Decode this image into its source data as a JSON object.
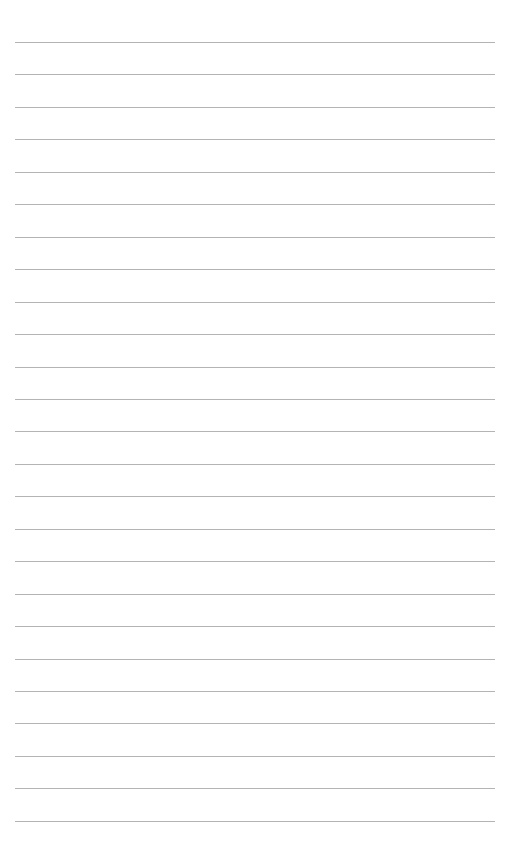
{
  "page": {
    "type": "lined-paper",
    "line_count": 25,
    "line_color": "#b4b4b4",
    "first_line_y": 42,
    "line_spacing": 32.45
  }
}
